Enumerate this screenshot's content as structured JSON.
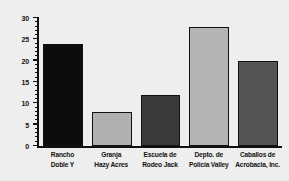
{
  "chart_data": {
    "type": "bar",
    "title": "",
    "subtitle": "",
    "xlabel": "",
    "ylabel": "",
    "ylim": [
      0,
      30
    ],
    "grid": false,
    "legend": null,
    "y_ticks": [
      0,
      5,
      10,
      15,
      20,
      25,
      30
    ],
    "y_tick_labels": [
      "0",
      "5",
      "10",
      "15",
      "20",
      "25",
      "30"
    ],
    "y_minor_tick_step": 1,
    "categories": [
      "Rancho Doble Y",
      "Granja Hazy Acres",
      "Escuela de Rodeo Jack",
      "Depto. de Policía Valley",
      "Caballos de Acrobacia, Inc."
    ],
    "category_lines": [
      [
        "Rancho",
        "Doble Y"
      ],
      [
        "Granja",
        "Hazy Acres"
      ],
      [
        "Escuela de",
        "Rodeo Jack"
      ],
      [
        "Depto. de",
        "Policía Valley"
      ],
      [
        "Caballos de",
        "Acrobacia, Inc."
      ]
    ],
    "values": [
      24,
      8,
      12,
      28,
      20
    ],
    "bar_colors": [
      "#0d0d0d",
      "#b0b0b0",
      "#3a3a3a",
      "#b4b4b4",
      "#555555"
    ],
    "bar_edge_color": "#111111",
    "axis_color": "#111111",
    "background_color": "#eeeeee",
    "plot_background_color": "#eeeeee"
  }
}
